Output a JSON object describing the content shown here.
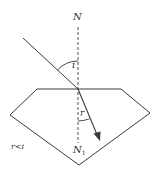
{
  "diagram": {
    "labels": {
      "normal_top": "N",
      "normal_bottom": "N",
      "normal_bottom_subscript": "1",
      "incidence_angle": "i",
      "refraction_angle": "r",
      "relation": "r<i"
    },
    "colors": {
      "line": "#3a3a3a",
      "text": "#333333",
      "background": "#ffffff"
    }
  }
}
